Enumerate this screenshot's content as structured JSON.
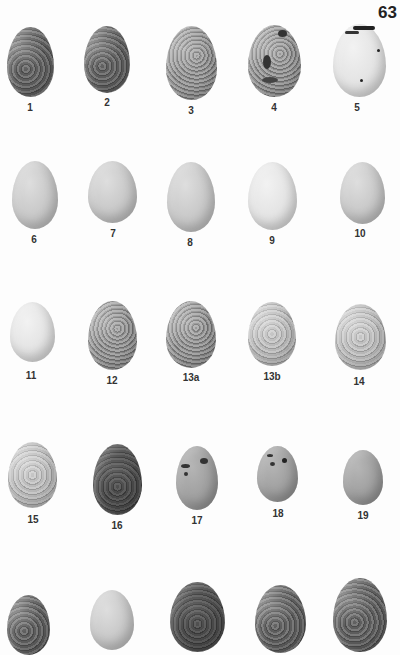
{
  "page": {
    "number": "63",
    "background": "#fdfdfd"
  },
  "plate": {
    "rows": [
      {
        "eggs": [
          {
            "label": "1",
            "texture": "dark-mottled"
          },
          {
            "label": "2",
            "texture": "dark-speckled"
          },
          {
            "label": "3",
            "texture": "light-speckled"
          },
          {
            "label": "4",
            "texture": "blotched"
          },
          {
            "label": "5",
            "texture": "white-scrawled"
          }
        ]
      },
      {
        "eggs": [
          {
            "label": "6",
            "texture": "plain"
          },
          {
            "label": "7",
            "texture": "plain"
          },
          {
            "label": "8",
            "texture": "plain"
          },
          {
            "label": "9",
            "texture": "plain-white"
          },
          {
            "label": "10",
            "texture": "plain"
          }
        ]
      },
      {
        "eggs": [
          {
            "label": "11",
            "texture": "plain"
          },
          {
            "label": "12",
            "texture": "mottled"
          },
          {
            "label": "13a",
            "texture": "mottled"
          },
          {
            "label": "13b",
            "texture": "light-speckled"
          },
          {
            "label": "14",
            "texture": "light-speckled"
          }
        ]
      },
      {
        "eggs": [
          {
            "label": "15",
            "texture": "light-speckled"
          },
          {
            "label": "16",
            "texture": "very-dark"
          },
          {
            "label": "17",
            "texture": "blotched"
          },
          {
            "label": "18",
            "texture": "blotched"
          },
          {
            "label": "19",
            "texture": "medium-speckled"
          }
        ]
      },
      {
        "eggs": [
          {
            "label": "",
            "texture": "dark-mottled"
          },
          {
            "label": "",
            "texture": "plain"
          },
          {
            "label": "",
            "texture": "very-dark"
          },
          {
            "label": "",
            "texture": "dark-mottled"
          },
          {
            "label": "",
            "texture": "dark-mottled"
          }
        ]
      }
    ]
  }
}
